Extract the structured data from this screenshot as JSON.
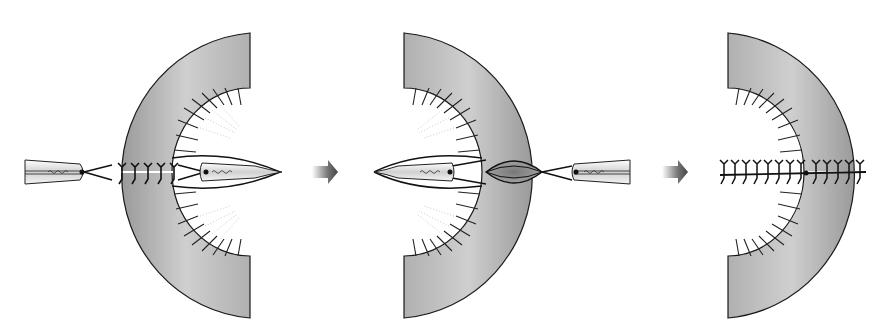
{
  "figure": {
    "background": "#ffffff",
    "colors": {
      "tissue_dark": "#8e8e8e",
      "tissue_light": "#d8d8d8",
      "outline": "#1a1a1a",
      "cavity": "#ffffff",
      "arrow": "#555555"
    },
    "panels": [
      {
        "id": "step-1",
        "label": "Needles passed through tissue, suture loops placed",
        "orientation": "opening-right"
      },
      {
        "id": "step-2",
        "label": "Needles drawn through, tissue edges approximated",
        "orientation": "opening-left"
      },
      {
        "id": "step-3",
        "label": "Sutures tied, wound closed",
        "orientation": "opening-left"
      }
    ],
    "arrows": [
      {
        "id": "arrow-1",
        "direction": "right"
      },
      {
        "id": "arrow-2",
        "direction": "right"
      }
    ]
  }
}
